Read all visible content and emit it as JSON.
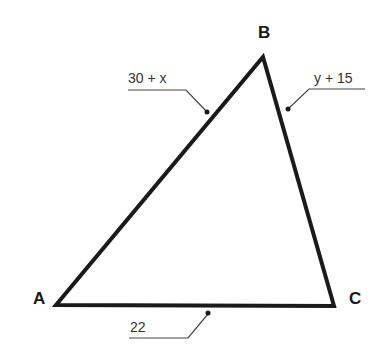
{
  "diagram": {
    "type": "triangle",
    "vertices": [
      {
        "label": "A",
        "x": 56,
        "y": 305
      },
      {
        "label": "B",
        "x": 263,
        "y": 57
      },
      {
        "label": "C",
        "x": 334,
        "y": 306
      }
    ],
    "sides": [
      {
        "between": "AB",
        "label": "30 + x"
      },
      {
        "between": "BC",
        "label": "y + 15"
      },
      {
        "between": "AC",
        "label": "22"
      }
    ],
    "colors": {
      "stroke": "#1a1a1a",
      "leader": "#444444",
      "background": "#ffffff"
    }
  }
}
